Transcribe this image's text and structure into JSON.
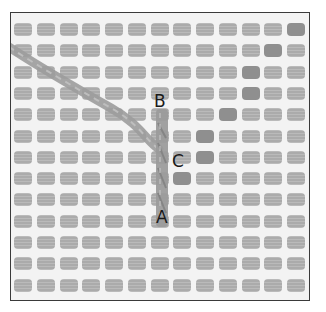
{
  "figure": {
    "labels": [
      {
        "id": "B",
        "text": "B",
        "x": 152,
        "y": 89
      },
      {
        "id": "C",
        "text": "C",
        "x": 170,
        "y": 150
      },
      {
        "id": "A",
        "text": "A",
        "x": 154,
        "y": 205
      }
    ],
    "grid": {
      "columns": 13,
      "rows": 13
    },
    "colors": {
      "background": "#f3f3f3",
      "hole": "#ababab",
      "thread": "#9a9a9a",
      "border": "#3a3a3a",
      "label": "#1a1a1a"
    }
  }
}
